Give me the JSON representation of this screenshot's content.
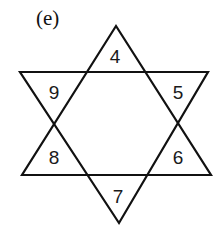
{
  "figure": {
    "label": "(e)",
    "type": "hexagram-number-puzzle",
    "line_color": "#111111",
    "background": "#ffffff"
  },
  "triangles": {
    "top": "4",
    "upper_right": "5",
    "lower_right": "6",
    "bottom": "7",
    "lower_left": "8",
    "upper_left": "9"
  }
}
